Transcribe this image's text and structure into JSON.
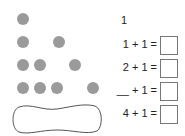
{
  "worksheet": {
    "dot_rows": [
      {
        "count": 1,
        "positions": [
          23
        ]
      },
      {
        "count": 2,
        "positions": [
          23,
          59
        ]
      },
      {
        "count": 3,
        "positions": [
          23,
          40,
          75
        ]
      },
      {
        "count": 4,
        "positions": [
          23,
          40,
          57,
          93
        ]
      }
    ],
    "start_number": "1",
    "equations": [
      {
        "label": "1 + 1 =",
        "answer": ""
      },
      {
        "label": "2 + 1 =",
        "answer": ""
      },
      {
        "label": "__ + 1 =",
        "answer": ""
      },
      {
        "label": "4 + 1 =",
        "answer": ""
      }
    ],
    "colors": {
      "dot": "#9a9a9a",
      "outline": "#555555"
    }
  }
}
